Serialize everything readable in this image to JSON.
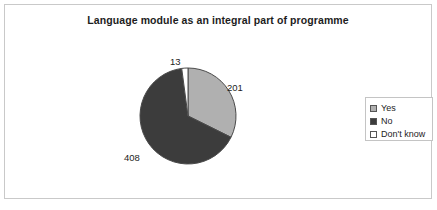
{
  "chart": {
    "title": "Language module as an integral part of programme",
    "frame_border_color": "#c9c9c9",
    "background": "#ffffff"
  },
  "legend": {
    "position": "right",
    "border_color": "#c4c4c4",
    "items": [
      {
        "label": "Yes",
        "swatch_name": "legend-swatch-yes",
        "color": "#b0b0b0"
      },
      {
        "label": "No",
        "swatch_name": "legend-swatch-no",
        "color": "#3c3c3c"
      },
      {
        "label": "Don't know",
        "swatch_name": "legend-swatch-dont-know",
        "color": "#ffffff"
      }
    ]
  },
  "labels": {
    "dont_know": "13",
    "yes": "201",
    "no": "408"
  },
  "chart_data": {
    "type": "pie",
    "title": "Language module as an integral part of programme",
    "xlabel": "",
    "ylabel": "",
    "categories": [
      "Yes",
      "No",
      "Don't know"
    ],
    "values": [
      201,
      408,
      13
    ],
    "data_labels": [
      "201",
      "408",
      "13"
    ],
    "total": 622,
    "colors": [
      "#b0b0b0",
      "#3c3c3c",
      "#ffffff"
    ],
    "slice_border_color": "#4a4a4a",
    "start_angle_deg": 0,
    "direction": "clockwise",
    "legend": [
      "Yes",
      "No",
      "Don't know"
    ],
    "legend_position": "right",
    "grid": false
  }
}
